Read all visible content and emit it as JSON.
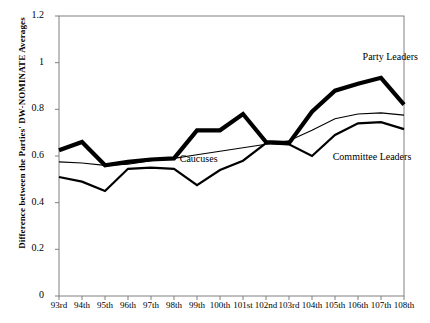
{
  "chart_data": {
    "type": "line",
    "title": "",
    "xlabel": "",
    "ylabel": "Difference between the Parties' DW-NOMINATE Averages",
    "categories": [
      "93rd",
      "94th",
      "95th",
      "96th",
      "97th",
      "98th",
      "99th",
      "100th",
      "101st",
      "102nd",
      "103rd",
      "104th",
      "105th",
      "106th",
      "107th",
      "108th"
    ],
    "ylim": [
      0,
      1.2
    ],
    "yticks": [
      "0",
      "0.2",
      "0.4",
      "0.6",
      "0.8",
      "1",
      "1.2"
    ],
    "ytick_values": [
      0,
      0.2,
      0.4,
      0.6,
      0.8,
      1.0,
      1.2
    ],
    "grid": false,
    "legend_position": "inline-annotations",
    "series": [
      {
        "name": "Party Leaders",
        "style": "thick",
        "color": "#000000",
        "values": [
          0.625,
          0.66,
          0.56,
          0.575,
          0.585,
          0.59,
          0.71,
          0.71,
          0.78,
          0.66,
          0.655,
          0.79,
          0.88,
          0.91,
          0.935,
          0.82
        ]
      },
      {
        "name": "Caucuses",
        "style": "thin",
        "color": "#000000",
        "values": [
          0.575,
          0.57,
          0.56,
          0.565,
          0.58,
          0.59,
          0.605,
          0.62,
          0.635,
          0.65,
          0.665,
          0.71,
          0.76,
          0.78,
          0.785,
          0.775
        ]
      },
      {
        "name": "Committee Leaders",
        "style": "medium",
        "color": "#000000",
        "values": [
          0.51,
          0.49,
          0.45,
          0.545,
          0.55,
          0.545,
          0.475,
          0.54,
          0.58,
          0.655,
          0.65,
          0.6,
          0.69,
          0.74,
          0.745,
          0.715
        ]
      }
    ],
    "annotations": [
      {
        "text": "Party Leaders",
        "x_index": 13.2,
        "y_value": 1.02,
        "anchor": "start"
      },
      {
        "text": "Caucuses",
        "x_index": 5.25,
        "y_value": 0.585,
        "anchor": "start"
      },
      {
        "text": "Committee Leaders",
        "x_index": 11.9,
        "y_value": 0.59,
        "anchor": "start"
      }
    ]
  }
}
